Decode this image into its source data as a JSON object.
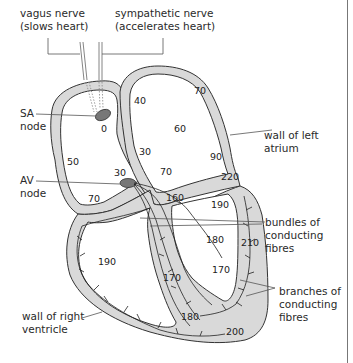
{
  "diagram": {
    "labels": {
      "vagus_nerve": [
        "vagus nerve",
        "(slows heart)"
      ],
      "sympathetic_nerve": [
        "sympathetic nerve",
        "(accelerates heart)"
      ],
      "sa_node": [
        "SA",
        "node"
      ],
      "av_node": [
        "AV",
        "node"
      ],
      "wall_left_atrium": [
        "wall of left",
        "atrium"
      ],
      "bundles": [
        "bundles of",
        "conducting",
        "fibres"
      ],
      "branches": [
        "branches of",
        "conducting",
        "fibres"
      ],
      "wall_right_ventricle": [
        "wall of right",
        "ventricle"
      ]
    },
    "times": {
      "sa": "0",
      "ra_top": "40",
      "la_top": "70",
      "la_mid": "60",
      "septum_atrial": "30",
      "ra_left": "50",
      "av_above": "30",
      "ra_bottom": "70",
      "interatrial_low": "70",
      "la_right": "90",
      "lv_wall_top": "220",
      "lv_septum_top": "160",
      "lv_upper": "190",
      "lv_mid": "180",
      "lv_wall_mid": "210",
      "lv_lower": "170",
      "rv_mid": "190",
      "septum_low": "170",
      "rv_bottom": "180",
      "apex": "200"
    },
    "colors": {
      "wall_fill": "#d9d9d9",
      "node_fill": "#777777",
      "outline": "#333333"
    }
  }
}
